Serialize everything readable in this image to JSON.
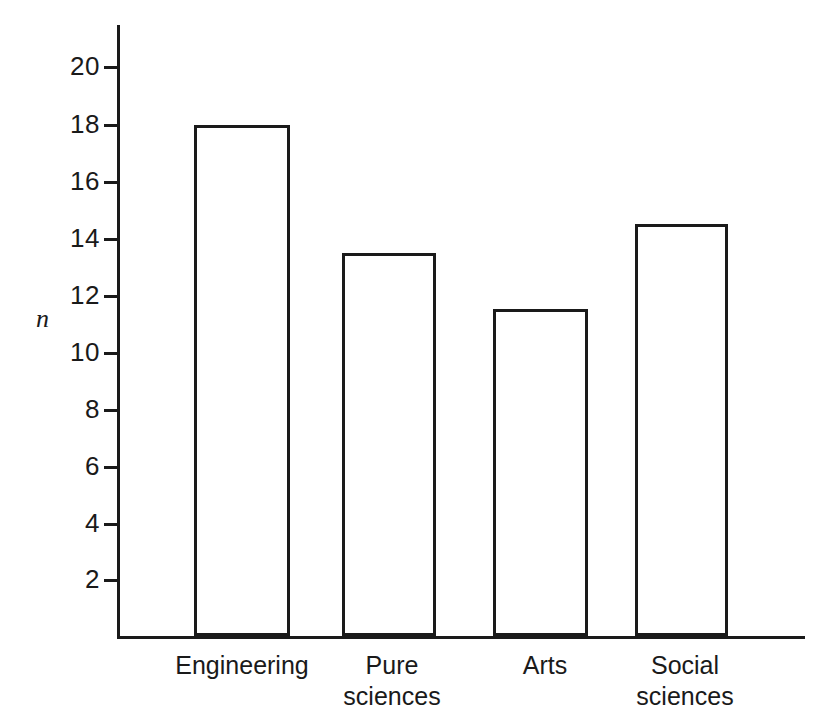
{
  "chart_data": {
    "type": "bar",
    "title": "",
    "subtitle": "",
    "xlabel": "",
    "ylabel": "n",
    "categories": [
      "Engineering",
      "Pure sciences",
      "Arts",
      "Social sciences"
    ],
    "category_lines": [
      [
        "Engineering"
      ],
      [
        "Pure",
        "sciences"
      ],
      [
        "Arts"
      ],
      [
        "Social",
        "sciences"
      ]
    ],
    "values": [
      18,
      13.5,
      11.5,
      14.5
    ],
    "ylim": [
      0,
      21
    ],
    "yticks": [
      2,
      4,
      6,
      8,
      10,
      12,
      14,
      16,
      18,
      20
    ],
    "ytick_labels": [
      "2",
      "4",
      "6",
      "8",
      "10",
      "12",
      "14",
      "16",
      "18",
      "20"
    ],
    "grid": false,
    "legend": null,
    "bar_fill": "#ffffff",
    "bar_edge": "#1a1a1a",
    "background": "#ffffff"
  },
  "geometry": {
    "axis_x_px": 117,
    "axis_baseline_px": 636,
    "axis_top_px": 25,
    "axis_right_px": 805,
    "px_per_unit": 28.4,
    "bars": [
      {
        "left": 194,
        "width": 96
      },
      {
        "left": 342,
        "width": 94
      },
      {
        "left": 493,
        "width": 95
      },
      {
        "left": 635,
        "width": 93
      }
    ],
    "tick_y_px": [
      580,
      524,
      467,
      410,
      353,
      296,
      239,
      182,
      125,
      67
    ],
    "label_boxes": [
      {
        "left": 120,
        "width": 244
      },
      {
        "left": 312,
        "width": 160
      },
      {
        "left": 470,
        "width": 150
      },
      {
        "left": 600,
        "width": 170
      }
    ]
  }
}
